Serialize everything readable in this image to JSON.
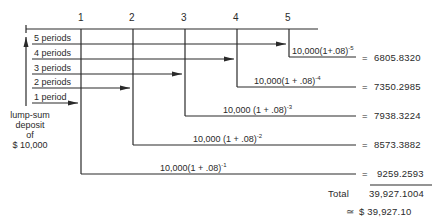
{
  "timeline": {
    "ticks": [
      "1",
      "2",
      "3",
      "4",
      "5"
    ]
  },
  "periods": [
    {
      "label": "5 periods"
    },
    {
      "label": "4 periods"
    },
    {
      "label": "3 periods"
    },
    {
      "label": "2 periods"
    },
    {
      "label": "1 period"
    }
  ],
  "deposit": {
    "line1": "lump-sum",
    "line2": "deposit",
    "line3": "of",
    "line4": "$ 10,000"
  },
  "terms": [
    {
      "base": "10,000(1+.08)",
      "exp": "-5",
      "equals": "=",
      "value": "6805.8320"
    },
    {
      "base": "10,000(1 + .08)",
      "exp": "-4",
      "equals": "=",
      "value": "7350.2985"
    },
    {
      "base": "10,000 (1 + .08)",
      "exp": "-3",
      "equals": "=",
      "value": "7938.3224"
    },
    {
      "base": "10,000 (1 + .08)",
      "exp": "-2",
      "equals": "=",
      "value": "8573.3882"
    },
    {
      "base": "10,000(1 + .08)",
      "exp": "-1",
      "equals": "=",
      "value": "9259.2593"
    }
  ],
  "total": {
    "label": "Total",
    "value": "39,927.1004",
    "approx_symbol": "≃",
    "rounded": "$ 39,927.10"
  }
}
